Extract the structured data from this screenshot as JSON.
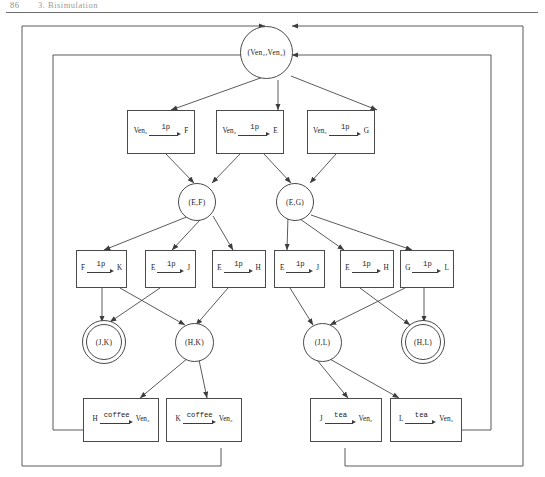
{
  "header": {
    "page_number": "86",
    "chapter_title": "3. Bisimulation"
  },
  "diagram": {
    "type": "state-transition-diagram",
    "root": {
      "id": "root",
      "label": "(Ven₂,Ven₃)",
      "shape": "circle",
      "accepting": false
    },
    "circles": [
      {
        "id": "ef",
        "label": "(E,F)",
        "shape": "circle",
        "accepting": false
      },
      {
        "id": "eg",
        "label": "(E,G)",
        "shape": "circle",
        "accepting": false
      },
      {
        "id": "jk",
        "label": "(J,K)",
        "shape": "double-circle",
        "accepting": true
      },
      {
        "id": "hk",
        "label": "(H,K)",
        "shape": "circle",
        "accepting": false
      },
      {
        "id": "jl",
        "label": "(J,L)",
        "shape": "circle",
        "accepting": false
      },
      {
        "id": "hl",
        "label": "(H,L)",
        "shape": "double-circle",
        "accepting": true
      }
    ],
    "rule_boxes_row1": [
      {
        "id": "r1",
        "from": "Ven₃",
        "action": "1p",
        "to": "F"
      },
      {
        "id": "r2",
        "from": "Ven₂",
        "action": "1p",
        "to": "E"
      },
      {
        "id": "r3",
        "from": "Ven₃",
        "action": "1p",
        "to": "G"
      }
    ],
    "rule_boxes_row2": [
      {
        "id": "r4",
        "from": "F",
        "action": "1p",
        "to": "K"
      },
      {
        "id": "r5",
        "from": "E",
        "action": "1p",
        "to": "J"
      },
      {
        "id": "r6",
        "from": "E",
        "action": "1p",
        "to": "H"
      },
      {
        "id": "r7",
        "from": "E",
        "action": "1p",
        "to": "J"
      },
      {
        "id": "r8",
        "from": "E",
        "action": "1p",
        "to": "H"
      },
      {
        "id": "r9",
        "from": "G",
        "action": "1p",
        "to": "L"
      }
    ],
    "rule_boxes_row3": [
      {
        "id": "r10",
        "from": "H",
        "action": "coffee",
        "to": "Ven₂"
      },
      {
        "id": "r11",
        "from": "K",
        "action": "coffee",
        "to": "Ven₃"
      },
      {
        "id": "r12",
        "from": "J",
        "action": "tea",
        "to": "Ven₂"
      },
      {
        "id": "r13",
        "from": "L",
        "action": "tea",
        "to": "Ven₃"
      }
    ],
    "colors": {
      "line": "#3d3d3d",
      "node_border": "#4a4a4a",
      "background": "#ffffff",
      "header_rule": "#6d6d6d"
    }
  }
}
